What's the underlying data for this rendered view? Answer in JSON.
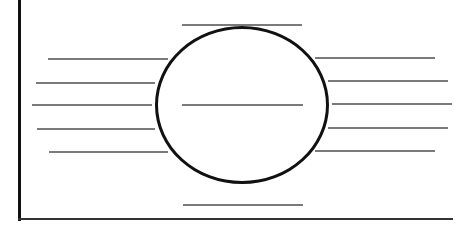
{
  "worksheet": {
    "type": "graphic-organizer",
    "layout": "central oval with blank answer lines",
    "colors": {
      "background": "#ffffff",
      "frame": "#111111",
      "oval_outline": "#111111",
      "answer_lines": "#7a7a7a"
    },
    "center_oval": {
      "label": "",
      "answer_line": {
        "x1": 182,
        "x2": 303,
        "y": 104
      }
    },
    "top_line": {
      "x1": 182,
      "x2": 302,
      "y": 24,
      "text": ""
    },
    "bottom_line": {
      "x1": 183,
      "x2": 303,
      "y": 204,
      "text": ""
    },
    "left_lines": [
      {
        "x1": 48,
        "x2": 168,
        "y": 58,
        "text": ""
      },
      {
        "x1": 36,
        "x2": 155,
        "y": 82,
        "text": ""
      },
      {
        "x1": 32,
        "x2": 152,
        "y": 104,
        "text": ""
      },
      {
        "x1": 37,
        "x2": 155,
        "y": 128,
        "text": ""
      },
      {
        "x1": 49,
        "x2": 168,
        "y": 151,
        "text": ""
      }
    ],
    "right_lines": [
      {
        "x1": 315,
        "x2": 435,
        "y": 57,
        "text": ""
      },
      {
        "x1": 328,
        "x2": 448,
        "y": 80,
        "text": ""
      },
      {
        "x1": 332,
        "x2": 452,
        "y": 103,
        "text": ""
      },
      {
        "x1": 328,
        "x2": 448,
        "y": 127,
        "text": ""
      },
      {
        "x1": 315,
        "x2": 435,
        "y": 150,
        "text": ""
      }
    ]
  }
}
